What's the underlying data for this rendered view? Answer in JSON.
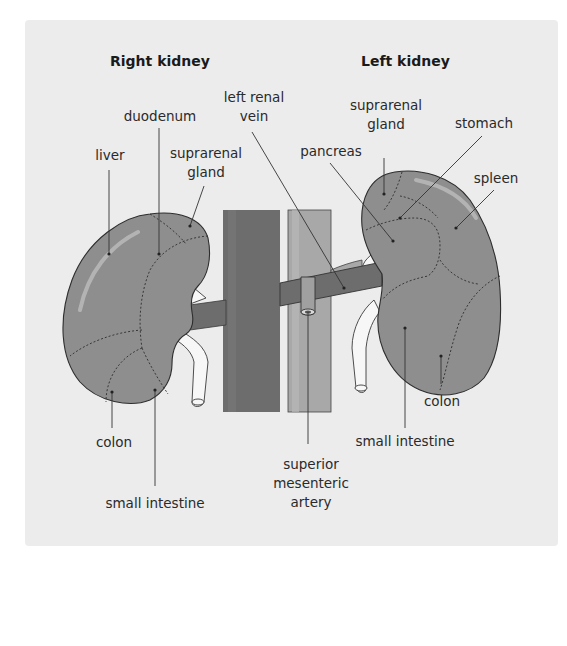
{
  "figure": {
    "type": "anatomical diagram",
    "colors": {
      "page_background": "#ffffff",
      "panel_background": "#ececec",
      "kidney_fill": "#8e8e8e",
      "ivc_fill": "#6d6d6d",
      "aorta_fill": "#a8a8a8",
      "renal_vein_fill": "#6d6d6d",
      "ureter_fill": "#f7f7f7",
      "text": "#2a2a2a"
    }
  },
  "titles": {
    "right_kidney": "Right kidney",
    "left_kidney": "Left kidney"
  },
  "right_kidney_labels": {
    "liver": "liver",
    "duodenum": "duodenum",
    "suprarenal_line1": "suprarenal",
    "suprarenal_line2": "gland",
    "colon": "colon",
    "small_intestine": "small intestine"
  },
  "center_labels": {
    "left_renal_vein_line1": "left renal",
    "left_renal_vein_line2": "vein",
    "sma_line1": "superior",
    "sma_line2": "mesenteric",
    "sma_line3": "artery"
  },
  "left_kidney_labels": {
    "suprarenal_line1": "suprarenal",
    "suprarenal_line2": "gland",
    "stomach": "stomach",
    "pancreas": "pancreas",
    "spleen": "spleen",
    "colon": "colon",
    "small_intestine": "small intestine"
  }
}
